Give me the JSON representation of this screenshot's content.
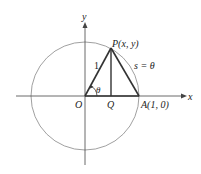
{
  "diagram": {
    "axes": {
      "x_label": "x",
      "y_label": "y"
    },
    "points": {
      "origin": "O",
      "P": "P(x, y)",
      "Q": "Q",
      "A": "A(1, 0)"
    },
    "labels": {
      "radius": "1",
      "angle": "θ",
      "arc": "s = θ"
    },
    "colors": {
      "circle": "#888888",
      "axes": "#444444",
      "triangle": "#333333"
    }
  }
}
